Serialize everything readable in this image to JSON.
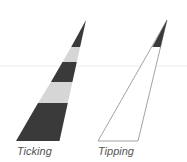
{
  "labels": {
    "left": "Ticking",
    "right": "Tipping"
  },
  "colors": {
    "dark": "#3a3a3a",
    "light": "#d6d6d6",
    "outline": "#8a8a8a",
    "guide": "#e8e8e8",
    "text": "#555555"
  }
}
